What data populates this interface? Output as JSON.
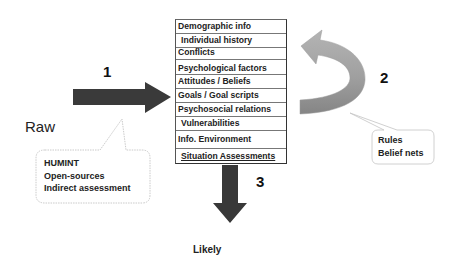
{
  "diagram": {
    "input_label": "Raw",
    "output_label": "Likely",
    "steps": [
      {
        "number": "1",
        "description": "Input arrow from raw sources into model"
      },
      {
        "number": "2",
        "description": "Feedback loop arrow"
      },
      {
        "number": "3",
        "description": "Output arrow to likely"
      }
    ],
    "model_box": {
      "rows": [
        "Demographic info",
        "Individual history",
        "Conflicts",
        "Psychological factors",
        "Attitudes / Beliefs",
        "Goals / Goal scripts",
        "Psychosocial relations",
        "Vulnerabilities",
        "Info. Environment",
        "Situation Assessments"
      ]
    },
    "sources_callout": {
      "lines": [
        "HUMINT",
        "Open-sources",
        "Indirect assessment"
      ]
    },
    "rules_callout": {
      "lines": [
        "Rules",
        "Belief nets"
      ]
    },
    "colors": {
      "arrow_dark": "#333333",
      "curved_arrow_light": "#a8a8a8",
      "curved_arrow_dark": "#8a8a8a",
      "callout_border": "#bbbbbb"
    }
  }
}
